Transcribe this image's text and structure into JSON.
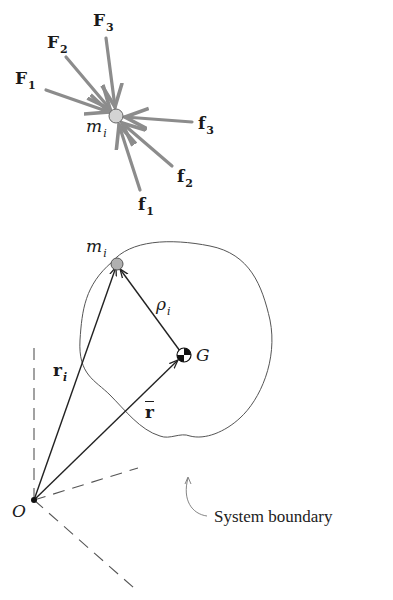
{
  "top_diagram": {
    "particle": {
      "label": "m",
      "subscript": "i",
      "center": [
        116,
        116
      ],
      "radius": 7,
      "fill": "#d3d3d3"
    },
    "external_forces": [
      {
        "label": "F",
        "subscript": "1",
        "from": [
          46,
          90
        ],
        "to": [
          110,
          112
        ]
      },
      {
        "label": "F",
        "subscript": "2",
        "from": [
          66,
          57
        ],
        "to": [
          111,
          110
        ]
      },
      {
        "label": "F",
        "subscript": "3",
        "from": [
          106,
          38
        ],
        "to": [
          115,
          108
        ]
      }
    ],
    "internal_forces": [
      {
        "label": "f",
        "subscript": "1",
        "from": [
          140,
          190
        ],
        "to": [
          118,
          124
        ]
      },
      {
        "label": "f",
        "subscript": "2",
        "from": [
          172,
          166
        ],
        "to": [
          121,
          122
        ]
      },
      {
        "label": "f",
        "subscript": "3",
        "from": [
          192,
          122
        ],
        "to": [
          124,
          117
        ]
      }
    ],
    "force_color": "#8c8c8c"
  },
  "bottom_diagram": {
    "origin": {
      "label": "O",
      "point": [
        34,
        500
      ]
    },
    "particle": {
      "label": "m",
      "subscript": "i",
      "center": [
        117,
        264
      ]
    },
    "mass_center": {
      "label": "G",
      "center": [
        184,
        355
      ]
    },
    "vectors": [
      {
        "name": "r_i",
        "label": "r",
        "subscript": "i",
        "from": [
          34,
          500
        ],
        "to": [
          117,
          264
        ]
      },
      {
        "name": "r_bar",
        "label": "r",
        "overbar": true,
        "from": [
          34,
          500
        ],
        "to": [
          184,
          355
        ]
      },
      {
        "name": "rho_i",
        "label": "ρ",
        "subscript": "i",
        "from": [
          184,
          355
        ],
        "to": [
          117,
          264
        ]
      }
    ],
    "boundary_label": "System boundary"
  }
}
